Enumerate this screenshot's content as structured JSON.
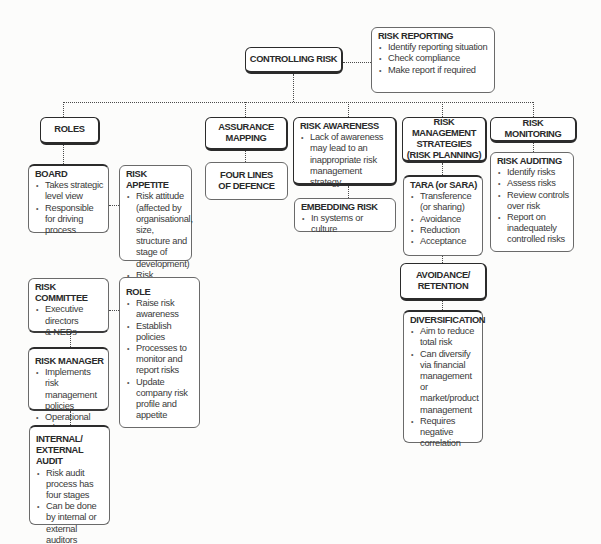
{
  "diagram": {
    "root": {
      "title": "CONTROLLING RISK"
    },
    "risk_reporting": {
      "title": "RISK REPORTING",
      "bullets": [
        "Identify reporting situation",
        "Check compliance",
        "Make report if required"
      ]
    },
    "branches": {
      "roles": {
        "title": "ROLES"
      },
      "assurance_mapping": {
        "title_lines": [
          "ASSURANCE",
          "MAPPING"
        ]
      },
      "risk_awareness": {
        "title": "RISK AWARENESS",
        "bullets": [
          "Lack of awareness may lead to an inappropriate risk management strategy"
        ]
      },
      "risk_management_strategies": {
        "title_lines": [
          "RISK MANAGEMENT",
          "STRATEGIES",
          "(RISK PLANNING)"
        ]
      },
      "risk_monitoring": {
        "title": "RISK MONITORING"
      }
    },
    "board": {
      "title": "BOARD",
      "bullets": [
        "Takes strategic level view",
        "Responsible for driving process"
      ]
    },
    "risk_appetite": {
      "title": "RISK APPETITE",
      "bullets": [
        "Risk attitude (affected by organisational, size, structure and stage of development)",
        "Risk capacity"
      ]
    },
    "four_lines": {
      "title_lines": [
        "FOUR LINES",
        "OF DEFENCE"
      ]
    },
    "embedding_risk": {
      "title": "EMBEDDING RISK",
      "bullets": [
        "In systems or culture"
      ]
    },
    "tara": {
      "title": "TARA (or SARA)",
      "bullets": [
        "Transference (or sharing)",
        "Avoidance",
        "Reduction",
        "Acceptance"
      ]
    },
    "risk_auditing": {
      "title": "RISK AUDITING",
      "bullets": [
        "Identify risks",
        "Assess risks",
        "Review controls over risk",
        "Report on inadequately controlled risks"
      ]
    },
    "avoidance_retention": {
      "title_lines": [
        "AVOIDANCE/",
        "RETENTION"
      ]
    },
    "diversification": {
      "title": "DIVERSIFICATION",
      "bullets": [
        "Aim to reduce total risk",
        "Can diversify via financial management or market/product management",
        "Requires negative correlation"
      ]
    },
    "risk_committee": {
      "title": "RISK COMMITTEE",
      "bullets": [
        "Executive directors & NEDs"
      ]
    },
    "role": {
      "title": "ROLE",
      "bullets": [
        "Raise risk awareness",
        "Establish policies",
        "Processes to monitor and report risks",
        "Update company risk profile and appetite"
      ]
    },
    "risk_manager": {
      "title": "RISK MANAGER",
      "bullets": [
        "Implements risk management policies",
        "Operational role"
      ]
    },
    "internal_external_audit": {
      "title_lines": [
        "INTERNAL/",
        "EXTERNAL AUDIT"
      ],
      "bullets": [
        "Risk audit process has four stages",
        "Can be done by internal or external auditors"
      ]
    }
  }
}
